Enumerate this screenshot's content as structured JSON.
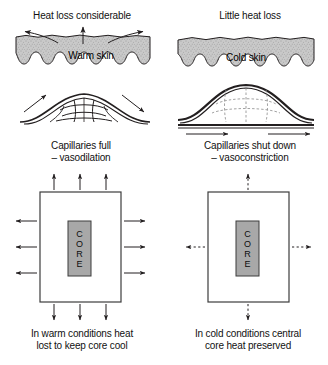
{
  "figure": {
    "background_color": "#ffffff",
    "line_color": "#231f20",
    "skin_fill": "#c8c8c8",
    "core_fill": "#a8a8a8"
  },
  "panels": {
    "left": {
      "heading": "Heat loss considerable",
      "skin_label": "Warm skin",
      "capillary_caption_line1": "Capillaries full",
      "capillary_caption_line2": "– vasodilation",
      "core_label_letters": [
        "C",
        "O",
        "R",
        "E"
      ],
      "footer_line1": "In warm conditions heat",
      "footer_line2": "lost to keep core cool",
      "arrow_style": "solid",
      "arrows_per_side": 3
    },
    "right": {
      "heading": "Little heat loss",
      "skin_label": "Cold skin",
      "capillary_caption_line1": "Capillaries shut down",
      "capillary_caption_line2": "– vasoconstriction",
      "core_label_letters": [
        "C",
        "O",
        "R",
        "E"
      ],
      "footer_line1": "In cold conditions central",
      "footer_line2": "core heat preserved",
      "arrow_style": "dashed",
      "arrows_per_side": 1
    }
  }
}
